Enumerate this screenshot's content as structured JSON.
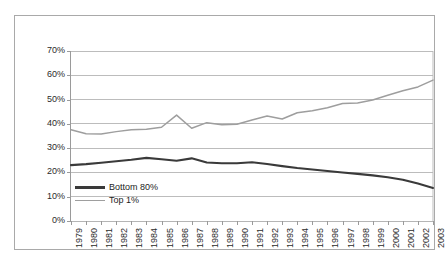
{
  "chart_data": {
    "type": "line",
    "title": "",
    "subtitle": "",
    "xlabel": "",
    "ylabel": "",
    "x": [
      1979,
      1980,
      1981,
      1982,
      1983,
      1984,
      1985,
      1986,
      1987,
      1988,
      1989,
      1990,
      1991,
      1992,
      1993,
      1994,
      1995,
      1996,
      1997,
      1998,
      1999,
      2000,
      2001,
      2002,
      2003
    ],
    "categories": [
      "1979",
      "1980",
      "1981",
      "1982",
      "1983",
      "1984",
      "1985",
      "1986",
      "1987",
      "1988",
      "1989",
      "1990",
      "1991",
      "1992",
      "1993",
      "1994",
      "1995",
      "1996",
      "1997",
      "1998",
      "1999",
      "2000",
      "2001",
      "2002",
      "2003"
    ],
    "series": [
      {
        "name": "Bottom 80%",
        "color": "#3a3a3a",
        "values": [
          23.0,
          23.4,
          24.0,
          24.6,
          25.2,
          26.0,
          25.4,
          24.8,
          25.8,
          24.1,
          23.8,
          23.8,
          24.2,
          23.5,
          22.6,
          21.8,
          21.2,
          20.6,
          20.0,
          19.4,
          18.8,
          18.0,
          17.0,
          15.4,
          13.6
        ]
      },
      {
        "name": "Top 1%",
        "color": "#9e9e9e",
        "values": [
          37.6,
          35.9,
          35.8,
          36.8,
          37.6,
          37.8,
          38.6,
          43.6,
          38.2,
          40.5,
          39.6,
          39.8,
          41.6,
          43.2,
          42.0,
          44.6,
          45.4,
          46.6,
          48.4,
          48.6,
          49.8,
          51.8,
          53.6,
          55.2,
          58.0
        ]
      }
    ],
    "ylim": [
      0,
      70
    ],
    "ytick_values": [
      0,
      10,
      20,
      30,
      40,
      50,
      60,
      70
    ],
    "ytick_labels": [
      "0%",
      "10%",
      "20%",
      "30%",
      "40%",
      "50%",
      "60%",
      "70%"
    ],
    "xlim": [
      1979,
      2003
    ],
    "grid": "horizontal",
    "grid_color": "#b5b5b5",
    "legend_position": "lower-left-inside",
    "legend_entries": [
      "Bottom 80%",
      "Top 1%"
    ],
    "annotations": [],
    "frame": {
      "border_color": "#a9a9a9",
      "background": "#ffffff"
    }
  }
}
